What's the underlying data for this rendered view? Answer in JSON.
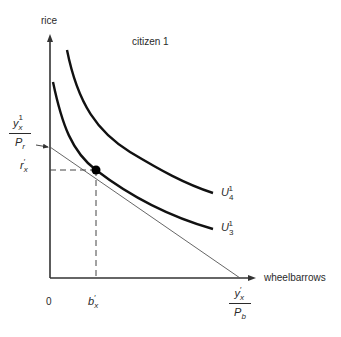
{
  "diagram": {
    "title": "citizen 1",
    "axes": {
      "y_label": "rice",
      "x_label": "wheelbarrows",
      "origin_label": "0"
    },
    "y_intercept": {
      "numerator": "y",
      "numerator_sub": "x",
      "numerator_sup": "1",
      "denominator": "P",
      "denominator_sub": "r"
    },
    "x_intercept": {
      "numerator": "y",
      "numerator_sub": "x",
      "numerator_sup": "′",
      "denominator": "P",
      "denominator_sub": "b"
    },
    "tangent_point": {
      "y_label": "r",
      "y_label_sub": "x",
      "y_label_sup": "′",
      "x_label": "b",
      "x_label_sub": "x",
      "x_label_sup": "′"
    },
    "curves": [
      {
        "id": "U4",
        "label": "U",
        "label_sub": "4",
        "label_sup": "1"
      },
      {
        "id": "U3",
        "label": "U",
        "label_sub": "3",
        "label_sup": "1"
      }
    ],
    "colors": {
      "axis": "#333333",
      "curve": "#111111",
      "budget_line": "#555555",
      "dashed": "#444444",
      "point": "#000000"
    }
  }
}
